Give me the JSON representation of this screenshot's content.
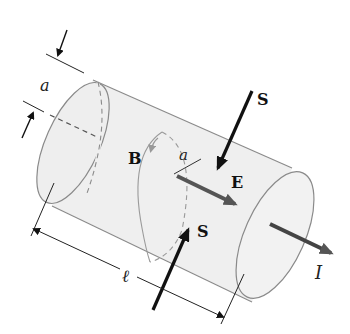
{
  "diagram": {
    "labels": {
      "radius_left": "a",
      "radius_inner": "a",
      "magnetic_field": "B",
      "electric_field": "E",
      "poynting_top": "S",
      "poynting_bottom": "S",
      "length": "ℓ",
      "current": "I"
    },
    "colors": {
      "cylinder_fill": "#eeeeee",
      "cylinder_edge": "#8a8a8a",
      "field_arrow": "#555555",
      "b_arrow": "#999999",
      "s_arrow": "#111111",
      "dimension_line": "#222222"
    }
  }
}
